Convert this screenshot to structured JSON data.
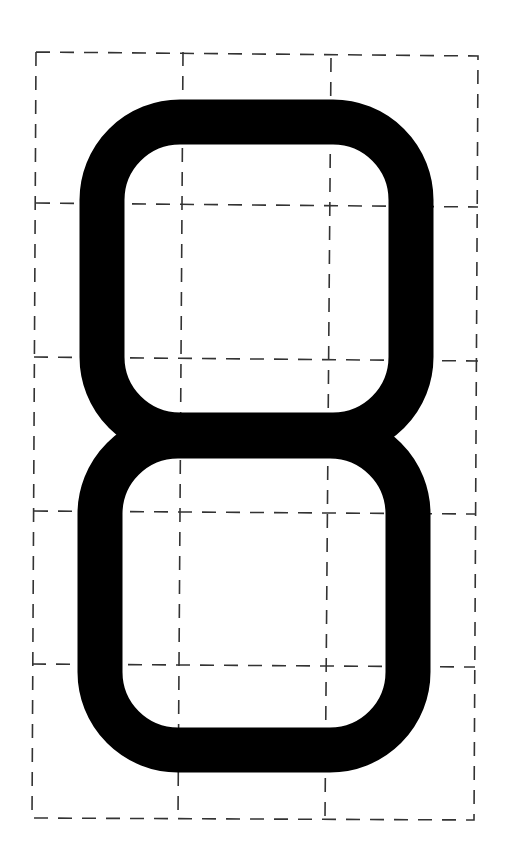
{
  "diagram": {
    "glyph": "8",
    "colors": {
      "background": "#ffffff",
      "glyph": "#000000",
      "grid": "#333333"
    },
    "grid": {
      "columns": 3,
      "rows": 5,
      "line_style": "dashed"
    }
  }
}
